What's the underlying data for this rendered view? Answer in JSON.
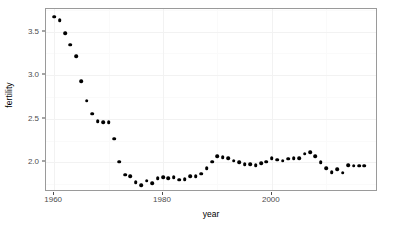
{
  "chart_data": {
    "type": "scatter",
    "title": "",
    "xlabel": "year",
    "ylabel": "fertility",
    "xlim": [
      1958.5,
      2019.5
    ],
    "ylim": [
      1.66,
      3.76
    ],
    "grid": true,
    "legend": null,
    "x_ticks": [
      1960,
      1980,
      2000
    ],
    "x_tick_labels": [
      "1960",
      "1980",
      "2000"
    ],
    "y_ticks": [
      2.0,
      2.5,
      3.0,
      3.5
    ],
    "y_tick_labels": [
      "2.0",
      "2.5",
      "3.0",
      "3.5"
    ],
    "point_color": "#000000",
    "panel_border_color": "#9a9a9a",
    "grid_color": "#f2f2f2",
    "x": [
      1960,
      1961,
      1962,
      1963,
      1964,
      1965,
      1966,
      1967,
      1968,
      1969,
      1970,
      1971,
      1972,
      1973,
      1974,
      1975,
      1976,
      1977,
      1978,
      1979,
      1980,
      1981,
      1982,
      1983,
      1984,
      1985,
      1986,
      1987,
      1988,
      1989,
      1990,
      1991,
      1992,
      1993,
      1994,
      1995,
      1996,
      1997,
      1998,
      1999,
      2000,
      2001,
      2002,
      2003,
      2004,
      2005,
      2006,
      2007,
      2008,
      2009,
      2010,
      2011,
      2012,
      2013,
      2014,
      2015,
      2016,
      2017
    ],
    "y": [
      3.67,
      3.63,
      3.48,
      3.35,
      3.22,
      2.93,
      2.71,
      2.56,
      2.47,
      2.46,
      2.46,
      2.27,
      2.01,
      1.86,
      1.84,
      1.77,
      1.74,
      1.79,
      1.76,
      1.82,
      1.83,
      1.82,
      1.83,
      1.8,
      1.81,
      1.84,
      1.84,
      1.87,
      1.93,
      2.01,
      2.07,
      2.06,
      2.05,
      2.02,
      2.0,
      1.98,
      1.98,
      1.97,
      1.99,
      2.01,
      2.05,
      2.03,
      2.02,
      2.04,
      2.05,
      2.05,
      2.1,
      2.12,
      2.07,
      2.0,
      1.93,
      1.89,
      1.92,
      1.88,
      1.97,
      1.96,
      1.96,
      1.96
    ]
  },
  "axes": {
    "y_title": "fertility",
    "x_title": "year"
  }
}
